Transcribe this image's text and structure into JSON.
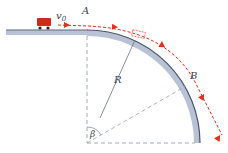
{
  "diagram": {
    "labels": {
      "velocity": "v",
      "velocity_sub": "0",
      "point_a": "A",
      "point_b": "B",
      "radius": "R",
      "angle": "β"
    },
    "colors": {
      "track_fill": "#b8c2d4",
      "track_edge": "#4a5568",
      "trajectory": "#e0301e",
      "car": "#d4281a",
      "dashed": "#9aa0a8",
      "label": "#3a4250"
    }
  }
}
